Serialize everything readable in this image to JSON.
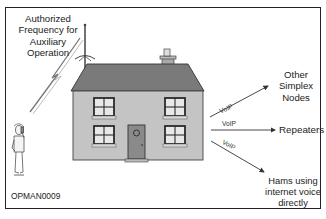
{
  "figure": {
    "id_label": "OPMAN0009",
    "source_label": "Authorized Frequency for Auxiliary Operation",
    "source_lines": [
      "Authorized",
      "Frequency for",
      "Auxiliary",
      "Operation"
    ],
    "hub": "House with antenna (VoIP gateway node)",
    "links": [
      {
        "label": "VoIP",
        "target": "Other Simplex Nodes",
        "target_lines": [
          "Other",
          "Simplex",
          "Nodes"
        ]
      },
      {
        "label": "VoIP",
        "target": "Repeaters"
      },
      {
        "label": "VoIP",
        "target": "Hams using internet voice directly",
        "target_lines": [
          "Hams using",
          "internet voice",
          "directly"
        ]
      }
    ],
    "colors": {
      "roof": "#7a7a7a",
      "wall": "#c4c4c4",
      "door": "#8a8a8a",
      "window_frame": "#2a2a2a",
      "window_pane": "#e8e8e8",
      "line": "#333333",
      "frame": "#222222"
    }
  }
}
